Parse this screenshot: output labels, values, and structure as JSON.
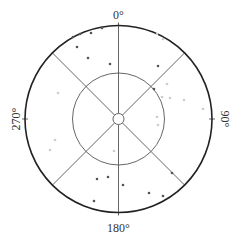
{
  "diagram": {
    "type": "polar-scatter",
    "center": [
      118.5,
      119
    ],
    "outer_radius": 93.5,
    "inner_radius": 46,
    "hub_radius": 5.5,
    "spoke_angles_deg": [
      0,
      45,
      135,
      180,
      225,
      315
    ],
    "angle_labels": [
      {
        "text": "0°",
        "angle": 0
      },
      {
        "text": "90°",
        "angle": 90
      },
      {
        "text": "180°",
        "angle": 180
      },
      {
        "text": "270°",
        "angle": 270
      }
    ],
    "colors": {
      "outer_ring": "#222222",
      "grid": "#555555",
      "point_dark": "#555555",
      "point_faint": "#cccccc",
      "label": "#333333"
    },
    "points": [
      {
        "x": 73,
        "y": 37,
        "tone": "dark"
      },
      {
        "x": 80,
        "y": 34,
        "tone": "dark"
      },
      {
        "x": 91,
        "y": 33,
        "tone": "dark"
      },
      {
        "x": 102,
        "y": 28,
        "tone": "dark"
      },
      {
        "x": 77,
        "y": 47,
        "tone": "dark"
      },
      {
        "x": 88,
        "y": 58,
        "tone": "dark"
      },
      {
        "x": 110,
        "y": 64,
        "tone": "dark"
      },
      {
        "x": 157,
        "y": 34,
        "tone": "faint"
      },
      {
        "x": 163,
        "y": 39,
        "tone": "faint"
      },
      {
        "x": 158,
        "y": 66,
        "tone": "dark"
      },
      {
        "x": 154,
        "y": 89,
        "tone": "dark"
      },
      {
        "x": 167,
        "y": 84,
        "tone": "faint"
      },
      {
        "x": 162,
        "y": 97,
        "tone": "faint"
      },
      {
        "x": 170,
        "y": 98,
        "tone": "faint"
      },
      {
        "x": 184,
        "y": 100,
        "tone": "faint"
      },
      {
        "x": 203,
        "y": 109,
        "tone": "faint"
      },
      {
        "x": 157,
        "y": 117,
        "tone": "faint"
      },
      {
        "x": 158,
        "y": 125,
        "tone": "faint"
      },
      {
        "x": 58,
        "y": 93,
        "tone": "faint"
      },
      {
        "x": 55,
        "y": 140,
        "tone": "faint"
      },
      {
        "x": 50,
        "y": 150,
        "tone": "faint"
      },
      {
        "x": 114,
        "y": 151,
        "tone": "faint"
      },
      {
        "x": 97,
        "y": 179,
        "tone": "dark"
      },
      {
        "x": 108,
        "y": 177,
        "tone": "dark"
      },
      {
        "x": 123,
        "y": 185,
        "tone": "dark"
      },
      {
        "x": 94,
        "y": 201,
        "tone": "dark"
      },
      {
        "x": 149,
        "y": 193,
        "tone": "dark"
      },
      {
        "x": 163,
        "y": 196,
        "tone": "dark"
      },
      {
        "x": 172,
        "y": 173,
        "tone": "dark"
      }
    ]
  }
}
